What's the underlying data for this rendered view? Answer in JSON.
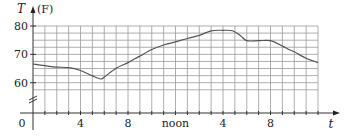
{
  "chart_data": {
    "type": "line",
    "title": "",
    "xlabel": "t",
    "ylabel": "T",
    "ylabel_unit": "(F)",
    "x_origin_label": "0",
    "xlim": [
      0,
      24
    ],
    "ylim_display": [
      57,
      82
    ],
    "y_axis_break": true,
    "grid": true,
    "x_grid_step": 1,
    "y_grid_step": 2.5,
    "x_ticks": [
      {
        "value": 0,
        "label": "0"
      },
      {
        "value": 4,
        "label": "4"
      },
      {
        "value": 8,
        "label": "8"
      },
      {
        "value": 12,
        "label": "noon"
      },
      {
        "value": 16,
        "label": "4"
      },
      {
        "value": 20,
        "label": "8"
      }
    ],
    "y_ticks": [
      {
        "value": 60,
        "label": "60"
      },
      {
        "value": 70,
        "label": "70"
      },
      {
        "value": 80,
        "label": "80"
      }
    ],
    "series": [
      {
        "name": "Temperature",
        "x": [
          0,
          1,
          2,
          3,
          4,
          5,
          5.7,
          6,
          7,
          8,
          9,
          10,
          11,
          12,
          13,
          14,
          15,
          16,
          16.8,
          17.5,
          18,
          19,
          20,
          21,
          21.5,
          22,
          23,
          24
        ],
        "y": [
          66.6,
          66.0,
          65.5,
          65.3,
          64.3,
          62.4,
          61.3,
          62.0,
          65.1,
          67.1,
          69.4,
          71.7,
          73.3,
          74.4,
          75.6,
          76.7,
          78.3,
          78.5,
          78.3,
          76.5,
          74.8,
          74.8,
          74.8,
          72.9,
          71.8,
          70.9,
          68.6,
          67.1
        ]
      }
    ]
  }
}
